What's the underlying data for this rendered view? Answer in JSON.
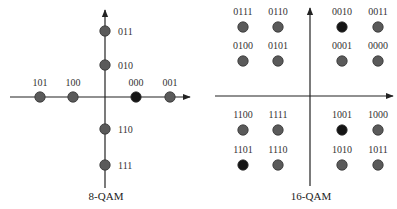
{
  "colors": {
    "axis": "#222222",
    "point_gray": "#5a5a5a",
    "point_dark": "#151515",
    "point_stroke": "#333333",
    "label": "#333333"
  },
  "diagrams": [
    {
      "id": "8qam",
      "caption": "8-QAM",
      "caption_pos": [
        106,
        200
      ],
      "axes": {
        "h": {
          "x1": 10,
          "x2": 190,
          "y": 97
        },
        "v": {
          "x": 105,
          "y1": 188,
          "y2": 10
        }
      },
      "points": [
        {
          "label": "011",
          "x": 105,
          "y": 31,
          "lx": 118,
          "ly": 35,
          "anchor": "start",
          "dark": false
        },
        {
          "label": "010",
          "x": 105,
          "y": 65,
          "lx": 118,
          "ly": 69,
          "anchor": "start",
          "dark": false
        },
        {
          "label": "101",
          "x": 40,
          "y": 97,
          "lx": 40,
          "ly": 86,
          "anchor": "middle",
          "dark": false
        },
        {
          "label": "100",
          "x": 73,
          "y": 97,
          "lx": 73,
          "ly": 86,
          "anchor": "middle",
          "dark": false
        },
        {
          "label": "000",
          "x": 136,
          "y": 97,
          "lx": 136,
          "ly": 86,
          "anchor": "middle",
          "dark": true
        },
        {
          "label": "001",
          "x": 170,
          "y": 97,
          "lx": 170,
          "ly": 86,
          "anchor": "middle",
          "dark": false
        },
        {
          "label": "110",
          "x": 105,
          "y": 129,
          "lx": 118,
          "ly": 133,
          "anchor": "start",
          "dark": false
        },
        {
          "label": "111",
          "x": 105,
          "y": 165,
          "lx": 118,
          "ly": 169,
          "anchor": "start",
          "dark": false
        }
      ]
    },
    {
      "id": "16qam",
      "caption": "16-QAM",
      "caption_pos": [
        311,
        200
      ],
      "axes": {
        "h": {
          "x1": 215,
          "x2": 393,
          "y": 96
        },
        "v": {
          "x": 310,
          "y1": 186,
          "y2": 8
        }
      },
      "points": [
        {
          "label": "0111",
          "x": 243,
          "y": 27,
          "dark": false
        },
        {
          "label": "0110",
          "x": 278,
          "y": 27,
          "dark": false
        },
        {
          "label": "0010",
          "x": 342,
          "y": 27,
          "dark": true
        },
        {
          "label": "0011",
          "x": 378,
          "y": 27,
          "dark": false
        },
        {
          "label": "0100",
          "x": 243,
          "y": 61,
          "dark": false
        },
        {
          "label": "0101",
          "x": 278,
          "y": 61,
          "dark": false
        },
        {
          "label": "0001",
          "x": 342,
          "y": 61,
          "dark": false
        },
        {
          "label": "0000",
          "x": 378,
          "y": 61,
          "dark": false
        },
        {
          "label": "1100",
          "x": 243,
          "y": 130,
          "dark": false
        },
        {
          "label": "1111",
          "x": 278,
          "y": 130,
          "dark": false
        },
        {
          "label": "1001",
          "x": 342,
          "y": 130,
          "dark": true
        },
        {
          "label": "1000",
          "x": 378,
          "y": 130,
          "dark": false
        },
        {
          "label": "1101",
          "x": 243,
          "y": 165,
          "dark": true
        },
        {
          "label": "1110",
          "x": 278,
          "y": 165,
          "dark": false
        },
        {
          "label": "1010",
          "x": 342,
          "y": 165,
          "dark": false
        },
        {
          "label": "1011",
          "x": 378,
          "y": 165,
          "dark": false
        }
      ]
    }
  ]
}
